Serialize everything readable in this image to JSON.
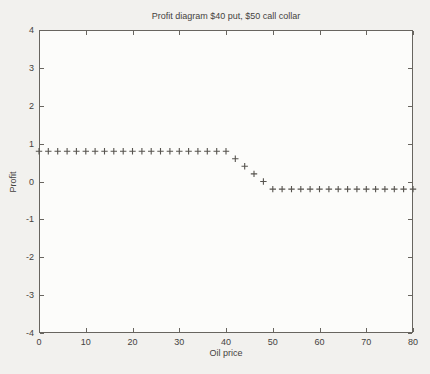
{
  "figure": {
    "title": "Profit diagram $40 put, $50 call collar",
    "xlabel": "Oil price",
    "ylabel": "Profit"
  },
  "chart_data": {
    "type": "scatter",
    "marker": "+",
    "title": "Profit diagram $40 put, $50 call collar",
    "xlabel": "Oil price",
    "ylabel": "Profit",
    "xlim": [
      0,
      80
    ],
    "ylim": [
      -4,
      4
    ],
    "xticks": [
      0,
      10,
      20,
      30,
      40,
      50,
      60,
      70,
      80
    ],
    "yticks": [
      -4,
      -3,
      -2,
      -1,
      0,
      1,
      2,
      3,
      4
    ],
    "grid": false,
    "legend": null,
    "series": [
      {
        "name": "collar-profit",
        "x": [
          0,
          2,
          4,
          6,
          8,
          10,
          12,
          14,
          16,
          18,
          20,
          22,
          24,
          26,
          28,
          30,
          32,
          34,
          36,
          38,
          40,
          42,
          44,
          46,
          48,
          50,
          52,
          54,
          56,
          58,
          60,
          62,
          64,
          66,
          68,
          70,
          72,
          74,
          76,
          78,
          80
        ],
        "y": [
          0.8,
          0.8,
          0.8,
          0.8,
          0.8,
          0.8,
          0.8,
          0.8,
          0.8,
          0.8,
          0.8,
          0.8,
          0.8,
          0.8,
          0.8,
          0.8,
          0.8,
          0.8,
          0.8,
          0.8,
          0.8,
          0.6,
          0.4,
          0.2,
          0.0,
          -0.2,
          -0.2,
          -0.2,
          -0.2,
          -0.2,
          -0.2,
          -0.2,
          -0.2,
          -0.2,
          -0.2,
          -0.2,
          -0.2,
          -0.2,
          -0.2,
          -0.2,
          -0.2
        ]
      }
    ],
    "colors": {
      "page_bg": "#f2f1ee",
      "plot_bg": "#fcfcfa",
      "axis": "#68655f",
      "marker": "#56534e",
      "text": "#454240"
    }
  }
}
